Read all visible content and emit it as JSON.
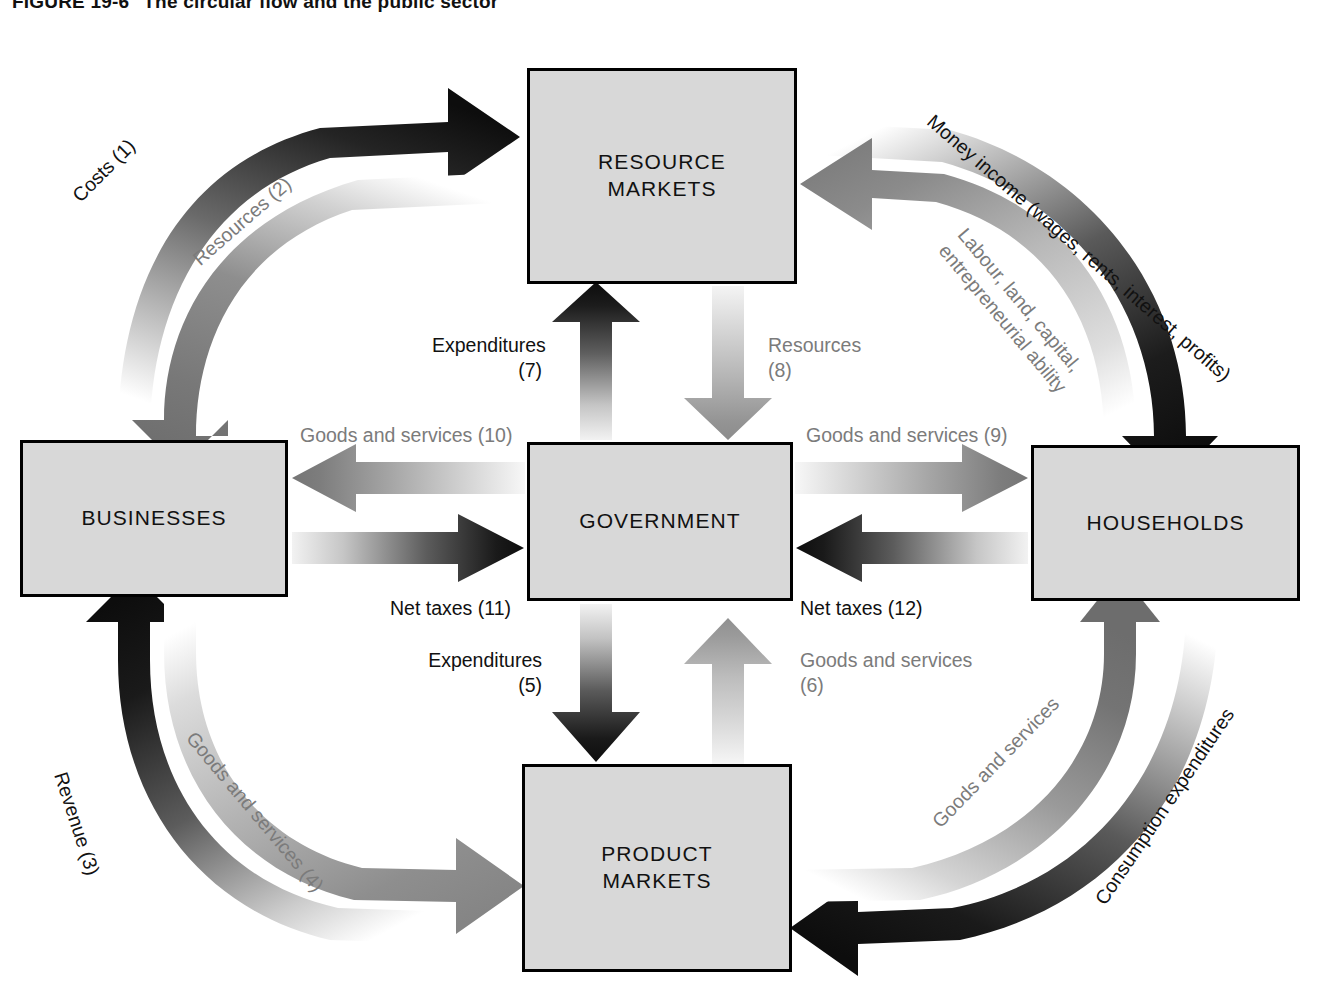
{
  "figure": {
    "number": "FIGURE 19-6",
    "title": "The circular flow and the public sector"
  },
  "colors": {
    "box_fill": "#d8d8d8",
    "box_border": "#000000",
    "dark_flow": "#111111",
    "mid_flow": "#6e6e6e",
    "light_flow": "#b4b4b4",
    "page_background": "#ffffff"
  },
  "nodes": [
    {
      "id": "resource-markets",
      "label": "RESOURCE\nMARKETS"
    },
    {
      "id": "businesses",
      "label": "BUSINESSES"
    },
    {
      "id": "government",
      "label": "GOVERNMENT"
    },
    {
      "id": "households",
      "label": "HOUSEHOLDS"
    },
    {
      "id": "product-markets",
      "label": "PRODUCT\nMARKETS"
    }
  ],
  "flows": [
    {
      "id": "costs",
      "number": "(1)",
      "label": "Costs (1)",
      "from": "businesses",
      "to": "resource-markets",
      "tone": "dark"
    },
    {
      "id": "resources-to-business",
      "number": "(2)",
      "label": "Resources (2)",
      "from": "resource-markets",
      "to": "businesses",
      "tone": "mid"
    },
    {
      "id": "revenue",
      "number": "(3)",
      "label": "Revenue (3)",
      "from": "product-markets",
      "to": "businesses",
      "tone": "dark"
    },
    {
      "id": "goods-to-product",
      "number": "(4)",
      "label": "Goods and services (4)",
      "from": "businesses",
      "to": "product-markets",
      "tone": "light"
    },
    {
      "id": "gov-expenditures-product",
      "number": "(5)",
      "label": "Expenditures",
      "from": "government",
      "to": "product-markets",
      "tone": "dark"
    },
    {
      "id": "goods-to-gov",
      "number": "(6)",
      "label": "Goods and services",
      "from": "product-markets",
      "to": "government",
      "tone": "light"
    },
    {
      "id": "gov-expenditures-resource",
      "number": "(7)",
      "label": "Expenditures",
      "from": "government",
      "to": "resource-markets",
      "tone": "dark"
    },
    {
      "id": "resources-to-gov",
      "number": "(8)",
      "label": "Resources",
      "from": "resource-markets",
      "to": "government",
      "tone": "light"
    },
    {
      "id": "goods-to-households",
      "number": "(9)",
      "label": "Goods and services (9)",
      "from": "government",
      "to": "households",
      "tone": "mid"
    },
    {
      "id": "goods-to-businesses",
      "number": "(10)",
      "label": "Goods and services (10)",
      "from": "government",
      "to": "businesses",
      "tone": "mid"
    },
    {
      "id": "net-taxes-businesses",
      "number": "(11)",
      "label": "Net taxes (11)",
      "from": "businesses",
      "to": "government",
      "tone": "dark"
    },
    {
      "id": "net-taxes-households",
      "number": "(12)",
      "label": "Net taxes (12)",
      "from": "households",
      "to": "government",
      "tone": "dark"
    },
    {
      "id": "money-income",
      "number": "",
      "label": "Money income (wages, rents, interest, profits)",
      "from": "resource-markets",
      "to": "households",
      "tone": "dark"
    },
    {
      "id": "resource-supply",
      "number": "",
      "label": "Labour, land, capital,\nentrepreneurial ability",
      "from": "households",
      "to": "resource-markets",
      "tone": "light"
    },
    {
      "id": "consumption-expenditures",
      "number": "",
      "label": "Consumption expenditures",
      "from": "households",
      "to": "product-markets",
      "tone": "dark"
    },
    {
      "id": "goods-to-households-outer",
      "number": "",
      "label": "Goods and services",
      "from": "product-markets",
      "to": "households",
      "tone": "mid"
    }
  ],
  "labels": {
    "costs": "Costs (1)",
    "resources_2": "Resources (2)",
    "revenue": "Revenue (3)",
    "goods_services_4": "Goods and services (4)",
    "expenditures_5_line1": "Expenditures",
    "expenditures_5_line2": "(5)",
    "goods_services_6_line1": "Goods and services",
    "goods_services_6_line2": "(6)",
    "expenditures_7_line1": "Expenditures",
    "expenditures_7_line2": "(7)",
    "resources_8_line1": "Resources",
    "resources_8_line2": "(8)",
    "goods_services_9": "Goods and services (9)",
    "goods_services_10": "Goods and services (10)",
    "net_taxes_11": "Net taxes (11)",
    "net_taxes_12": "Net taxes (12)",
    "money_income": "Money income (wages, rents, interest, profits)",
    "resource_supply_line1": "Labour, land, capital,",
    "resource_supply_line2": "entrepreneurial ability",
    "consumption_expenditures": "Consumption expenditures",
    "goods_services_outer": "Goods and services"
  }
}
